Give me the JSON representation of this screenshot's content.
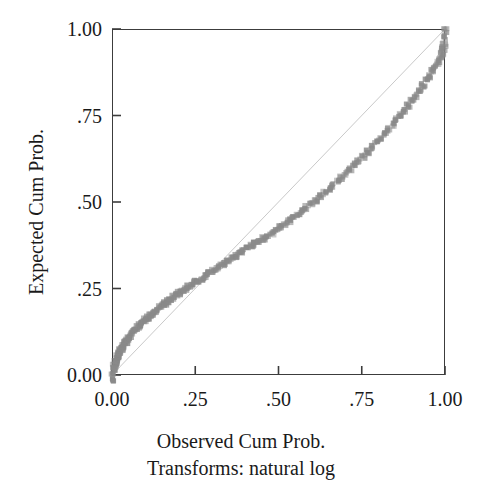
{
  "chart_data": {
    "type": "scatter",
    "title": "",
    "subtitle": "",
    "xlabel": "Observed Cum Prob.",
    "xlabel_note": "Transforms: natural log",
    "ylabel": "Expected Cum Prob.",
    "xlim": [
      0.0,
      1.0
    ],
    "ylim": [
      0.0,
      1.0
    ],
    "grid": false,
    "legend": null,
    "x_tick_values": [
      0.0,
      0.25,
      0.5,
      0.75,
      1.0
    ],
    "x_tick_labels": [
      "0.00",
      ".25",
      ".50",
      ".75",
      "1.00"
    ],
    "y_tick_values": [
      0.0,
      0.25,
      0.5,
      0.75,
      1.0
    ],
    "y_tick_labels": [
      "0.00",
      ".25",
      ".50",
      ".75",
      "1.00"
    ],
    "marker_color": "#8a8a8a",
    "reference_line_color": "#c9c9c9",
    "axis_color": "#3c3c3c",
    "series": [
      {
        "name": "Expected vs Observed",
        "marker": "square",
        "x": [
          0.0,
          0.002,
          0.004,
          0.006,
          0.008,
          0.01,
          0.012,
          0.014,
          0.016,
          0.018,
          0.02,
          0.023,
          0.026,
          0.029,
          0.032,
          0.035,
          0.038,
          0.042,
          0.046,
          0.05,
          0.055,
          0.06,
          0.065,
          0.07,
          0.076,
          0.082,
          0.088,
          0.094,
          0.1,
          0.107,
          0.114,
          0.121,
          0.128,
          0.135,
          0.143,
          0.151,
          0.159,
          0.167,
          0.175,
          0.184,
          0.193,
          0.202,
          0.211,
          0.22,
          0.23,
          0.24,
          0.25,
          0.26,
          0.27,
          0.28,
          0.291,
          0.302,
          0.313,
          0.324,
          0.335,
          0.346,
          0.358,
          0.37,
          0.382,
          0.394,
          0.406,
          0.418,
          0.43,
          0.442,
          0.455,
          0.468,
          0.481,
          0.494,
          0.507,
          0.52,
          0.533,
          0.546,
          0.559,
          0.572,
          0.585,
          0.598,
          0.611,
          0.624,
          0.637,
          0.65,
          0.663,
          0.676,
          0.689,
          0.702,
          0.715,
          0.728,
          0.741,
          0.754,
          0.767,
          0.78,
          0.793,
          0.806,
          0.818,
          0.83,
          0.842,
          0.854,
          0.866,
          0.878,
          0.89,
          0.901,
          0.912,
          0.923,
          0.934,
          0.944,
          0.954,
          0.963,
          0.971,
          0.978,
          0.985,
          0.99,
          0.994,
          0.997,
          0.999,
          1.0
        ],
        "y": [
          -0.012,
          0.004,
          0.016,
          0.026,
          0.033,
          0.039,
          0.044,
          0.049,
          0.053,
          0.057,
          0.061,
          0.066,
          0.071,
          0.076,
          0.081,
          0.086,
          0.09,
          0.096,
          0.101,
          0.107,
          0.113,
          0.119,
          0.125,
          0.131,
          0.137,
          0.143,
          0.149,
          0.154,
          0.16,
          0.166,
          0.172,
          0.178,
          0.183,
          0.189,
          0.195,
          0.201,
          0.207,
          0.213,
          0.219,
          0.225,
          0.231,
          0.237,
          0.243,
          0.249,
          0.255,
          0.261,
          0.268,
          0.274,
          0.28,
          0.287,
          0.294,
          0.301,
          0.308,
          0.315,
          0.321,
          0.328,
          0.336,
          0.343,
          0.35,
          0.358,
          0.365,
          0.372,
          0.379,
          0.386,
          0.394,
          0.402,
          0.41,
          0.418,
          0.427,
          0.436,
          0.445,
          0.454,
          0.464,
          0.474,
          0.484,
          0.494,
          0.504,
          0.515,
          0.526,
          0.537,
          0.548,
          0.559,
          0.571,
          0.583,
          0.595,
          0.607,
          0.619,
          0.632,
          0.645,
          0.658,
          0.671,
          0.684,
          0.697,
          0.71,
          0.723,
          0.737,
          0.751,
          0.765,
          0.779,
          0.793,
          0.807,
          0.821,
          0.836,
          0.85,
          0.864,
          0.878,
          0.891,
          0.903,
          0.915,
          0.927,
          0.94,
          0.955,
          0.975,
          0.995
        ]
      }
    ],
    "reference_line": {
      "name": "reference-diagonal",
      "from": [
        0.0,
        0.0
      ],
      "to": [
        1.0,
        1.0
      ]
    }
  }
}
